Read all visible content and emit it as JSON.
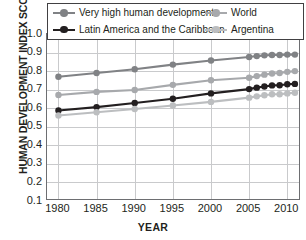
{
  "chart_data": {
    "type": "line",
    "title": "",
    "xlabel": "YEAR",
    "ylabel": "HUMAN DEVELOPMENT INDEX SCORE",
    "xlim": [
      1978.5,
      2011.8
    ],
    "ylim": [
      0.1,
      1.0
    ],
    "grid": true,
    "legend_position": "top",
    "ytick_labels": [
      "1.0",
      "0.9",
      "0.8",
      "0.7",
      "0.6",
      "0.5",
      "0.4",
      "0.3",
      "0.2",
      "0.1"
    ],
    "ytick_values": [
      1.0,
      0.9,
      0.8,
      0.7,
      0.6,
      0.5,
      0.4,
      0.3,
      0.2,
      0.1
    ],
    "xtick_labels": [
      "1980",
      "1985",
      "1990",
      "1995",
      "2000",
      "2005",
      "2010"
    ],
    "xtick_values": [
      1980,
      1985,
      1990,
      1995,
      2000,
      2005,
      2010
    ],
    "series": [
      {
        "name": "Very high human development",
        "color": "#808285",
        "x": [
          1980,
          1985,
          1990,
          1995,
          2000,
          2005,
          2006,
          2007,
          2008,
          2009,
          2010,
          2011
        ],
        "values": [
          0.77,
          0.79,
          0.81,
          0.835,
          0.857,
          0.876,
          0.881,
          0.885,
          0.887,
          0.887,
          0.889,
          0.889
        ]
      },
      {
        "name": "World",
        "color": "#a7a9ac",
        "x": [
          1980,
          1985,
          1990,
          1995,
          2000,
          2005,
          2006,
          2007,
          2008,
          2009,
          2010,
          2011
        ],
        "values": [
          0.671,
          0.688,
          0.698,
          0.726,
          0.751,
          0.764,
          0.773,
          0.781,
          0.787,
          0.79,
          0.796,
          0.8
        ]
      },
      {
        "name": "Latin America and the Caribbean",
        "color": "#231f20",
        "x": [
          1980,
          1985,
          1990,
          1995,
          2000,
          2005,
          2006,
          2007,
          2008,
          2009,
          2010,
          2011
        ],
        "values": [
          0.588,
          0.606,
          0.628,
          0.651,
          0.68,
          0.703,
          0.711,
          0.717,
          0.723,
          0.724,
          0.729,
          0.731
        ]
      },
      {
        "name": "Argentina",
        "color": "#bcbec0",
        "x": [
          1980,
          1985,
          1990,
          1995,
          2000,
          2005,
          2006,
          2007,
          2008,
          2009,
          2010,
          2011
        ],
        "values": [
          0.561,
          0.578,
          0.596,
          0.615,
          0.634,
          0.657,
          0.664,
          0.67,
          0.675,
          0.675,
          0.68,
          0.683
        ]
      }
    ]
  },
  "legend": {
    "items": [
      {
        "label": "Very high human development",
        "swatch": "line-marker-very-high"
      },
      {
        "label": "World",
        "swatch": "line-marker-world"
      },
      {
        "label": "Latin America and the Caribbean",
        "swatch": "line-marker-lac"
      },
      {
        "label": "Argentina",
        "swatch": "line-marker-argentina"
      }
    ]
  }
}
